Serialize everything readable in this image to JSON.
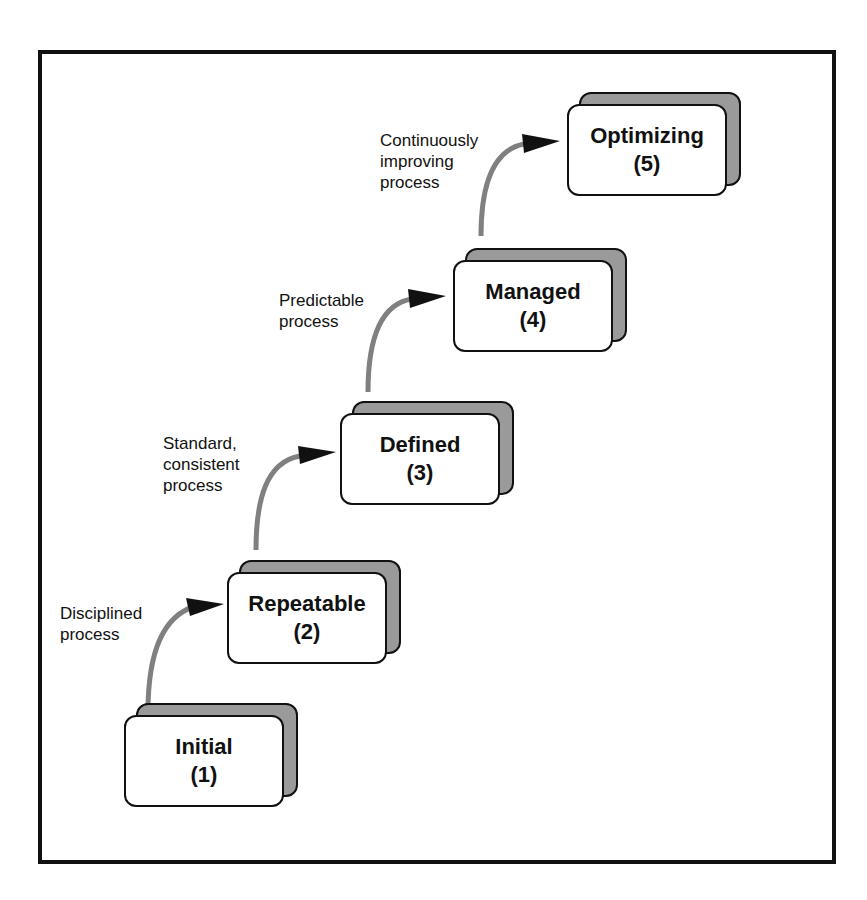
{
  "diagram": {
    "type": "maturity-staircase",
    "levels": [
      {
        "name": "Initial",
        "number": "(1)"
      },
      {
        "name": "Repeatable",
        "number": "(2)"
      },
      {
        "name": "Defined",
        "number": "(3)"
      },
      {
        "name": "Managed",
        "number": "(4)"
      },
      {
        "name": "Optimizing",
        "number": "(5)"
      }
    ],
    "transitions": [
      {
        "from": "Initial",
        "to": "Repeatable",
        "label_lines": [
          "Disciplined",
          "process"
        ]
      },
      {
        "from": "Repeatable",
        "to": "Defined",
        "label_lines": [
          "Standard,",
          "consistent",
          "process"
        ]
      },
      {
        "from": "Defined",
        "to": "Managed",
        "label_lines": [
          "Predictable",
          "process"
        ]
      },
      {
        "from": "Managed",
        "to": "Optimizing",
        "label_lines": [
          "Continuously",
          "improving",
          "process"
        ]
      }
    ],
    "colors": {
      "frame": "#111111",
      "box_fill": "#ffffff",
      "box_shadow": "#9a9a9a",
      "arrow_shaft": "#808080",
      "arrow_head": "#111111"
    }
  }
}
